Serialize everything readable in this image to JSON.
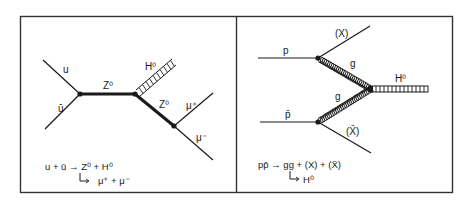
{
  "figure": {
    "panels": [
      {
        "id": "left",
        "title": "Quark-antiquark annihilation (associated Z0 H0 production)",
        "particles": {
          "incoming_1": "u",
          "incoming_2": "ū",
          "propagator": "Z⁰",
          "higgs": "H⁰",
          "outgoing_boson": "Z⁰",
          "lepton_plus": "μ⁺",
          "lepton_minus": "μ⁻"
        },
        "equation": {
          "line1": "u + ū → Z⁰ + H⁰",
          "line2": "μ⁺ + μ⁻"
        }
      },
      {
        "id": "right",
        "title": "Gluon fusion Higgs production",
        "particles": {
          "incoming_1": "p",
          "incoming_2": "p̄",
          "gluon_1": "g",
          "gluon_2": "g",
          "remnant_1": "(X)",
          "remnant_2": "(X̄)",
          "higgs": "H⁰"
        },
        "equation": {
          "line1": "pp̄ → gg + (X) + (X̄)",
          "line2": "H⁰"
        }
      }
    ],
    "colors": {
      "ink": "#1a1a1a",
      "background": "#ffffff",
      "frame": "#333333"
    }
  }
}
